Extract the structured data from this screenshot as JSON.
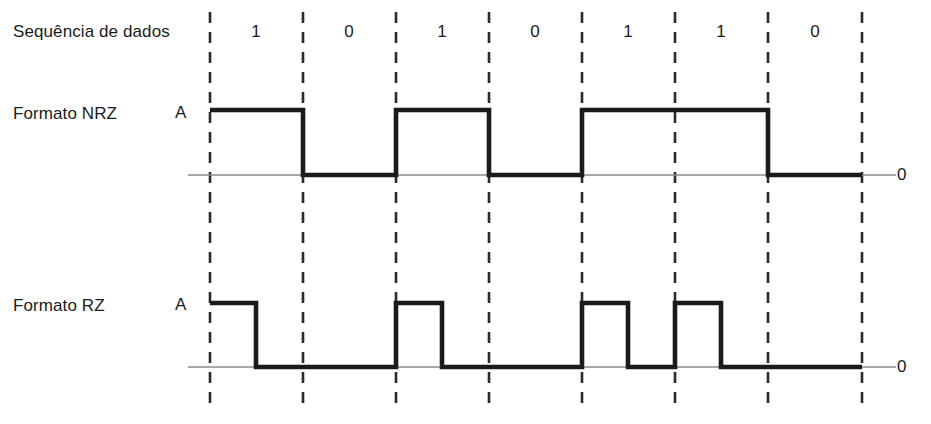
{
  "figure": {
    "background_color": "#ffffff",
    "waveform_color": "#1b1b1b",
    "baseline_color": "#8a8a8a",
    "gridline_color": "#2b2b2b"
  },
  "labels": {
    "sequence_row": "Sequência de dados",
    "nrz_row": "Formato NRZ",
    "rz_row": "Formato RZ",
    "amplitude_nrz": "A",
    "amplitude_rz": "A",
    "zero_nrz": "0",
    "zero_rz": "0"
  },
  "chart_data": {
    "type": "line",
    "xlabel": "",
    "ylabel": "",
    "grid": true,
    "gridlines_x": [
      210,
      303,
      396,
      489,
      582,
      675,
      768,
      862
    ],
    "legend_position": "none",
    "bit_sequence": [
      "1",
      "0",
      "1",
      "0",
      "1",
      "1",
      "0"
    ],
    "bit_centers_x": [
      256,
      349,
      442,
      535,
      628,
      721,
      815
    ],
    "bit_period_px": 93,
    "series": [
      {
        "name": "Formato NRZ",
        "levels": [
          "A",
          "0"
        ],
        "baseline_y": 175,
        "high_y": 110,
        "values": [
          1,
          0,
          1,
          0,
          1,
          1,
          0
        ],
        "description": "Non-return-to-zero: nível A durante todo o intervalo de bit 1, nível 0 durante o bit 0"
      },
      {
        "name": "Formato RZ",
        "levels": [
          "A",
          "0"
        ],
        "baseline_y": 367,
        "high_y": 303,
        "values": [
          1,
          0,
          1,
          0,
          1,
          1,
          0
        ],
        "duty_cycle": 0.5,
        "description": "Return-to-zero: nível A durante a primeira metade do intervalo de bit 1, retorna a 0 na segunda metade"
      }
    ]
  }
}
